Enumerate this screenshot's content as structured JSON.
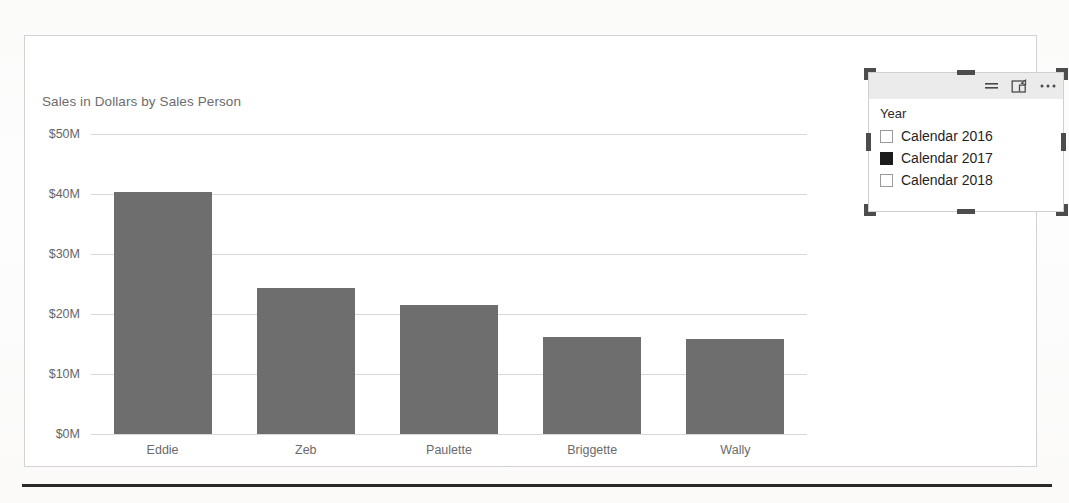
{
  "chart_data": {
    "type": "bar",
    "title": "Sales in Dollars by Sales Person",
    "xlabel": "",
    "ylabel": "",
    "categories": [
      "Eddie",
      "Zeb",
      "Paulette",
      "Briggette",
      "Wally"
    ],
    "values": [
      40.3,
      24.3,
      21.5,
      16.2,
      15.8
    ],
    "value_unit": "$M",
    "ylim": [
      0,
      50
    ],
    "ytick_values": [
      0,
      10,
      20,
      30,
      40,
      50
    ],
    "ytick_labels": [
      "$0M",
      "$10M",
      "$20M",
      "$30M",
      "$40M",
      "$50M"
    ],
    "grid": true,
    "legend": null,
    "series_color": "#6e6e6e"
  },
  "chart_visual": {
    "title": "Sales in Dollars by Sales Person"
  },
  "slicer": {
    "title": "Year",
    "header_icons": [
      {
        "name": "filter-icon",
        "glyph": "filter"
      },
      {
        "name": "focus-mode-icon",
        "glyph": "focus"
      },
      {
        "name": "more-options-icon",
        "glyph": "ellipsis"
      }
    ],
    "items": [
      {
        "label": "Calendar 2016",
        "checked": false
      },
      {
        "label": "Calendar 2017",
        "checked": true
      },
      {
        "label": "Calendar 2018",
        "checked": false
      }
    ]
  },
  "colors": {
    "bar_fill": "#6e6e6e",
    "gridline": "#d8d8d8",
    "axis_text": "#666666",
    "title_text": "#6d6d6d",
    "slicer_header_bg": "#ebebeb",
    "selection_handle": "#4c4c4c",
    "canvas_border": "#d2d2d2"
  }
}
